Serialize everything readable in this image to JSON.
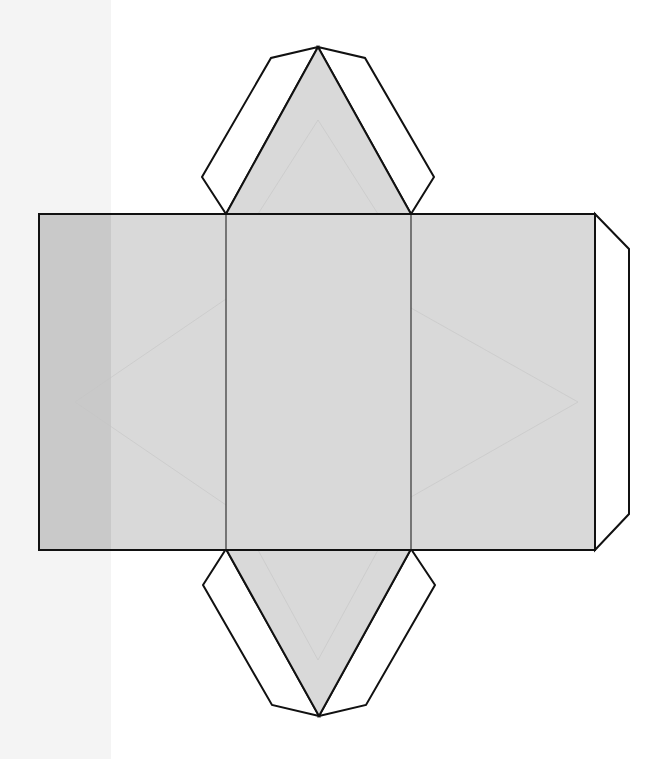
{
  "diagram": {
    "type": "net",
    "colors": {
      "page": "#ffffff",
      "scan_margin": "#f4f4f4",
      "face_fill": "#d9d9d9",
      "overlay_strip": "#c9c9c9",
      "tab_fill": "#ffffff",
      "outline": "#111111",
      "fold_line": "#333333",
      "show_through": "#c4c4c4"
    },
    "scan_margin": {
      "x": 0,
      "y": 0,
      "width": 111,
      "height": 759
    },
    "rectangle": {
      "x": 39,
      "y": 214,
      "width": 556,
      "height": 336
    },
    "overlay_strip": {
      "x": 39,
      "y": 214,
      "width": 72,
      "height": 336
    },
    "fold_lines_x": [
      226,
      411
    ],
    "faces": [
      {
        "name": "rect-face-left",
        "x": 39,
        "width": 187
      },
      {
        "name": "rect-face-middle",
        "x": 226,
        "width": 185
      },
      {
        "name": "rect-face-right",
        "x": 411,
        "width": 184
      }
    ],
    "top_triangle": {
      "points": "226,214 318,47 411,214"
    },
    "bottom_triangle": {
      "points": "226,549 319,716 411,549"
    },
    "tabs": [
      {
        "name": "top-left-glue-tab",
        "points": "226,214 202,177 271,58 318,47"
      },
      {
        "name": "top-right-glue-tab",
        "points": "411,214 434,177 365,58 318,47"
      },
      {
        "name": "bottom-left-glue-tab",
        "points": "226,549 203,585 272,705 319,716"
      },
      {
        "name": "bottom-right-glue-tab",
        "points": "411,549 435,585 366,705 319,716"
      },
      {
        "name": "right-glue-tab",
        "points": "595,214 629,249 629,514 595,550"
      }
    ],
    "show_through_lines": [
      "75,402 226,299",
      "75,402 226,505",
      "258,214 318,120 378,214",
      "411,308 578,402 411,497",
      "258,550 318,660 378,550"
    ]
  }
}
